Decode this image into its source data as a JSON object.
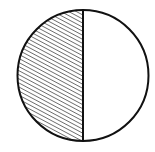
{
  "diagram": {
    "type": "fraction-circle",
    "total_parts": 2,
    "shaded_parts": 1,
    "fraction": "1/2",
    "shaded_side": "left",
    "fill_pattern": "diagonal-hatch",
    "colors": {
      "stroke": "#111111",
      "hatch": "#222222",
      "background": "#ffffff"
    },
    "geometry": {
      "cx": 83,
      "cy": 75.5,
      "r": 65.5
    }
  }
}
